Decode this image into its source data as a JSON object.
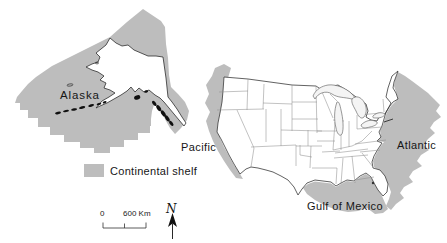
{
  "figure": {
    "labels": {
      "alaska": "Alaska",
      "pacific": "Pacific",
      "atlantic": "Atlantic",
      "gulf_of_mexico": "Gulf of Mexico"
    },
    "legend": {
      "shelf": "Continental shelf"
    },
    "scale_bar": {
      "start": "0",
      "distance": "600 Km"
    },
    "compass": {
      "north": "N"
    },
    "colors": {
      "shelf_fill": "#bdbdbd",
      "land_fill": "#ffffff",
      "coast_stroke": "#2e2e2e",
      "state_stroke": "#8f8f8f",
      "island_fill": "#101010",
      "lake_fill": "#f4f4f4",
      "background": "#ffffff"
    }
  }
}
